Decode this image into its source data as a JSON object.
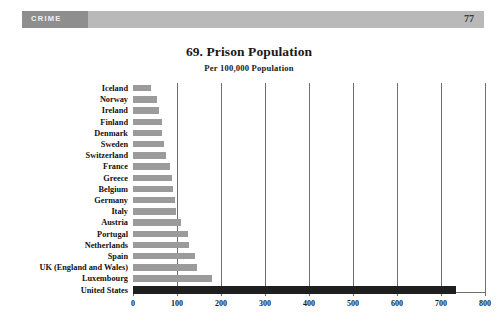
{
  "header": {
    "section_label": "CRIME",
    "page_number": "77"
  },
  "figure": {
    "title": "69. Prison Population",
    "subtitle": "Per 100,000 Population"
  },
  "chart_data": {
    "type": "bar",
    "orientation": "horizontal",
    "title": "69. Prison Population",
    "subtitle": "Per 100,000 Population",
    "xlabel": "",
    "ylabel": "",
    "xlim": [
      0,
      800
    ],
    "xticks": [
      0,
      100,
      200,
      300,
      400,
      500,
      600,
      700,
      800
    ],
    "xtick_labels": [
      "0",
      "100",
      "200",
      "300",
      "400",
      "500",
      "600",
      "700",
      "800"
    ],
    "grid": true,
    "grid_axis": "x",
    "legend": false,
    "bar_color": "#9b9b9b",
    "highlight_color": "#1f1f1f",
    "highlight_category": "United States",
    "categories": [
      "Iceland",
      "Norway",
      "Ireland",
      "Finland",
      "Denmark",
      "Sweden",
      "Switzerland",
      "France",
      "Greece",
      "Belgium",
      "Germany",
      "Italy",
      "Austria",
      "Portugal",
      "Netherlands",
      "Spain",
      "UK (England and Wales)",
      "Luxembourg",
      "United States"
    ],
    "values": [
      40,
      55,
      60,
      65,
      66,
      70,
      75,
      85,
      88,
      90,
      95,
      97,
      110,
      125,
      128,
      140,
      145,
      180,
      735
    ]
  }
}
